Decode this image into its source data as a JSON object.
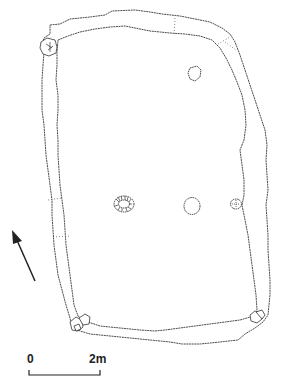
{
  "figure": {
    "type": "archaeological site plan"
  },
  "features": {
    "enclosure_wall": "double-outline wall/bank",
    "postholes": [
      {
        "id": "posthole-1",
        "style": "hatched",
        "cx": 124,
        "cy": 204
      },
      {
        "id": "posthole-2",
        "style": "dashed",
        "cx": 192,
        "cy": 206
      },
      {
        "id": "posthole-3",
        "style": "dashed-small",
        "cx": 236,
        "cy": 204
      }
    ],
    "pit": {
      "id": "pit-ne",
      "cx": 194,
      "cy": 74
    },
    "corner_stones": [
      "nw",
      "sw",
      "se"
    ]
  },
  "north_arrow": {
    "direction": "north-northwest"
  },
  "scale_bar": {
    "start_label": "0",
    "end_label": "2m"
  }
}
